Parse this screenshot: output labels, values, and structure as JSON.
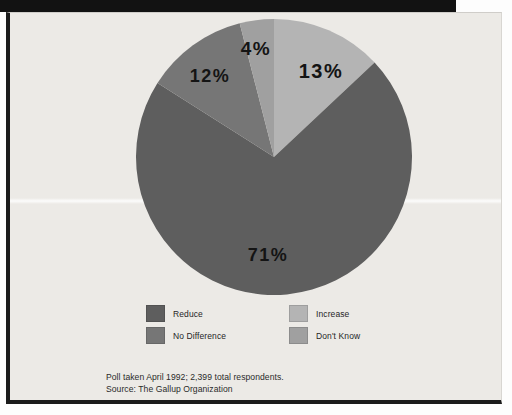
{
  "chart_data": {
    "type": "pie",
    "title": "",
    "subtitle": "",
    "xlabel": "",
    "ylabel": "",
    "legend_position": "bottom",
    "grid": false,
    "start_angle_deg": 0,
    "direction": "clockwise",
    "categories": [
      "Increase",
      "Reduce",
      "No Difference",
      "Don't Know"
    ],
    "values": [
      13,
      71,
      12,
      4
    ],
    "value_unit": "%",
    "data_labels": [
      "13%",
      "71%",
      "12%",
      "4%"
    ],
    "colors": [
      "#b4b4b4",
      "#5e5e5e",
      "#767676",
      "#a0a0a0"
    ],
    "slices": [
      {
        "label": "Increase",
        "value": 13,
        "data_label": "13%",
        "color": "#b4b4b4"
      },
      {
        "label": "Reduce",
        "value": 71,
        "data_label": "71%",
        "color": "#5e5e5e"
      },
      {
        "label": "No Difference",
        "value": 12,
        "data_label": "12%",
        "color": "#767676"
      },
      {
        "label": "Don't Know",
        "value": 4,
        "data_label": "4%",
        "color": "#a0a0a0"
      }
    ]
  },
  "legend": {
    "items": [
      {
        "label": "Reduce",
        "color": "#5e5e5e"
      },
      {
        "label": "Increase",
        "color": "#b4b4b4"
      },
      {
        "label": "No Difference",
        "color": "#767676"
      },
      {
        "label": "Don't Know",
        "color": "#a0a0a0"
      }
    ]
  },
  "footnote": {
    "line1": "Poll taken April 1992; 2,399 total respondents.",
    "line2": "Source: The Gallup Organization"
  },
  "labels": {
    "increase_pct": "13%",
    "reduce_pct": "71%",
    "no_difference_pct": "12%",
    "dont_know_pct": "4%"
  },
  "colors": {
    "paper": "#eceae6",
    "frame": "#1b1b1b",
    "text": "#262626"
  }
}
